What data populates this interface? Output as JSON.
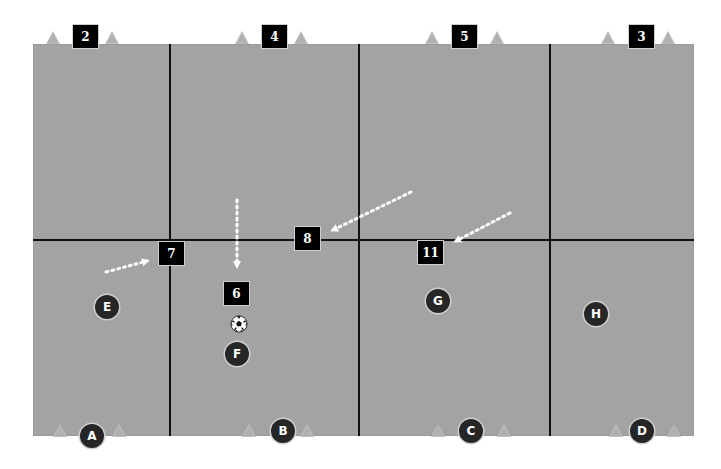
{
  "diagram": {
    "type": "soccer-drill-field",
    "colors": {
      "field": "#a3a3a3",
      "grid_line": "#111111",
      "box": "#000000",
      "player": "#262626",
      "cone": "#bdbdbd",
      "arrow": "#ffffff"
    },
    "top_markers": [
      {
        "label": "2"
      },
      {
        "label": "4"
      },
      {
        "label": "5"
      },
      {
        "label": "3"
      }
    ],
    "field_markers": [
      {
        "label": "7"
      },
      {
        "label": "8"
      },
      {
        "label": "11"
      },
      {
        "label": "6"
      }
    ],
    "field_players": [
      {
        "label": "E"
      },
      {
        "label": "F"
      },
      {
        "label": "G"
      },
      {
        "label": "H"
      }
    ],
    "bottom_players": [
      {
        "label": "A"
      },
      {
        "label": "B"
      },
      {
        "label": "C"
      },
      {
        "label": "D"
      }
    ],
    "ball": {
      "icon": "soccer-ball-icon"
    },
    "arrows": [
      {
        "name": "run-to-7",
        "style": "dotted"
      },
      {
        "name": "run-to-6",
        "style": "dotted"
      },
      {
        "name": "run-to-8",
        "style": "dotted"
      },
      {
        "name": "run-to-11",
        "style": "dotted"
      }
    ]
  }
}
